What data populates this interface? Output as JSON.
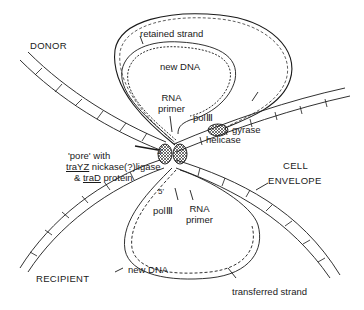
{
  "diagram": {
    "type": "bacterial conjugation DNA transfer schematic",
    "colors": {
      "ink": "#1a1a1a",
      "background": "#ffffff"
    },
    "regions": {
      "donor": "DONOR",
      "recipient": "RECIPIENT"
    },
    "labels": {
      "retained_strand": "retained strand",
      "new_dna_top": "new DNA",
      "rna_primer_top_1": "RNA",
      "rna_primer_top_2": "primer",
      "pol3_top": "polⅢ",
      "gyrase": "gyrase",
      "helicase": "helicase",
      "cell_envelope_1": "CELL",
      "cell_envelope_2": "ENVELOPE",
      "pore_line1": "'pore' with",
      "pore_line2_gene": "traYZ",
      "pore_line2_rest": " nickase(?)ligase",
      "pore_line3_amp": "& ",
      "pore_line3_gene": "traD",
      "pore_line3_rest": " protein",
      "end_3prime": "3'",
      "end_5prime": "5'",
      "pol3_bottom": "polⅢ",
      "rna_primer_bottom_1": "RNA",
      "rna_primer_bottom_2": "primer",
      "new_dna_bottom": "new DNA",
      "transferred_strand": "transferred strand"
    }
  }
}
